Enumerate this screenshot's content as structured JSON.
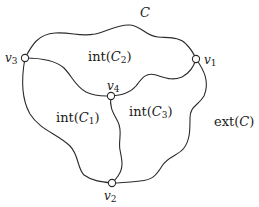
{
  "diagram": {
    "title_label": "C",
    "vertices": [
      {
        "id": "v1",
        "name": "v",
        "sub": "1",
        "x": 196,
        "y": 59
      },
      {
        "id": "v2",
        "name": "v",
        "sub": "2",
        "x": 112,
        "y": 183
      },
      {
        "id": "v3",
        "name": "v",
        "sub": "3",
        "x": 25,
        "y": 58
      },
      {
        "id": "v4",
        "name": "v",
        "sub": "4",
        "x": 111,
        "y": 96
      }
    ],
    "edges": [
      {
        "from": "v3",
        "to": "v1",
        "role": "outer-top"
      },
      {
        "from": "v3",
        "to": "v4",
        "role": "inner"
      },
      {
        "from": "v4",
        "to": "v1",
        "role": "inner"
      },
      {
        "from": "v3",
        "to": "v2",
        "role": "outer-left"
      },
      {
        "from": "v4",
        "to": "v2",
        "role": "inner"
      },
      {
        "from": "v1",
        "to": "v2",
        "role": "outer-right"
      }
    ],
    "regions": [
      {
        "id": "int-C2",
        "prefix": "int(",
        "var": "C",
        "sub": "2",
        "suffix": ")"
      },
      {
        "id": "int-C1",
        "prefix": "int(",
        "var": "C",
        "sub": "1",
        "suffix": ")"
      },
      {
        "id": "int-C3",
        "prefix": "int(",
        "var": "C",
        "sub": "3",
        "suffix": ")"
      },
      {
        "id": "ext-C",
        "prefix": "ext(",
        "var": "C",
        "sub": "",
        "suffix": ")"
      }
    ],
    "colors": {
      "stroke": "#2b2b2b",
      "background": "#ffffff",
      "text": "#1a1a1a"
    }
  }
}
